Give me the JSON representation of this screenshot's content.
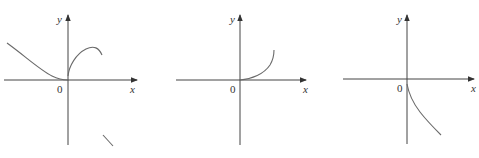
{
  "figure": {
    "colors": {
      "axis": "#444444",
      "curve": "#6a6a6a",
      "background": "#ffffff"
    },
    "panels": [
      {
        "id": "panel-1",
        "x_label": "x",
        "y_label": "y",
        "origin_label": "0",
        "description": "Curve decreasing from upper-left to touch origin; separate branch rising from origin curving to a peak then down; stray short line segment below right"
      },
      {
        "id": "panel-2",
        "x_label": "x",
        "y_label": "y",
        "origin_label": "0",
        "description": "Curve starting at origin, increasing and concave up for x > 0"
      },
      {
        "id": "panel-3",
        "x_label": "x",
        "y_label": "y",
        "origin_label": "0",
        "description": "Curve starting just below origin, decreasing for x > 0"
      }
    ]
  }
}
